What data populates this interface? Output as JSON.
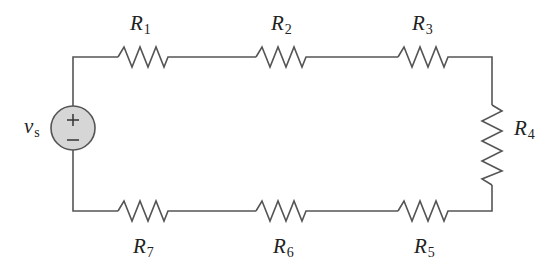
{
  "diagram": {
    "type": "series-circuit",
    "colors": {
      "wire": "#555555",
      "source_fill": "#d6d6d6",
      "text": "#222222",
      "background": "#ffffff"
    },
    "source": {
      "symbol": "v",
      "subscript": "s",
      "plus": "+",
      "minus": "−"
    },
    "resistors": [
      {
        "id": "R1",
        "symbol": "R",
        "subscript": "1",
        "position": "top-left"
      },
      {
        "id": "R2",
        "symbol": "R",
        "subscript": "2",
        "position": "top-middle"
      },
      {
        "id": "R3",
        "symbol": "R",
        "subscript": "3",
        "position": "top-right"
      },
      {
        "id": "R4",
        "symbol": "R",
        "subscript": "4",
        "position": "right-vertical"
      },
      {
        "id": "R5",
        "symbol": "R",
        "subscript": "5",
        "position": "bottom-right"
      },
      {
        "id": "R6",
        "symbol": "R",
        "subscript": "6",
        "position": "bottom-middle"
      },
      {
        "id": "R7",
        "symbol": "R",
        "subscript": "7",
        "position": "bottom-left"
      }
    ]
  }
}
